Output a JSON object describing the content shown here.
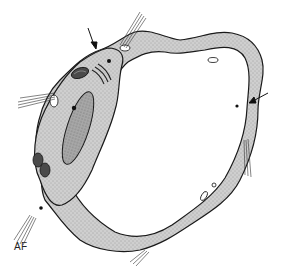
{
  "figure": {
    "labels": [
      {
        "text": "AF",
        "x": 14,
        "y": 248
      }
    ],
    "annotations": [
      {
        "type": "arrow",
        "target": "cell junction / filaments, upper left",
        "x1": 88,
        "y1": 28,
        "x2": 95,
        "y2": 48
      },
      {
        "type": "arrow",
        "target": "endothelial wall, right side",
        "x1": 268,
        "y1": 93,
        "x2": 250,
        "y2": 103
      }
    ],
    "colors": {
      "cytoplasm": "#c8c8c8",
      "outline": "#1a1a1a",
      "nucleus": "#9a9a9a",
      "organelle": "#555555",
      "background": "#ffffff"
    }
  }
}
